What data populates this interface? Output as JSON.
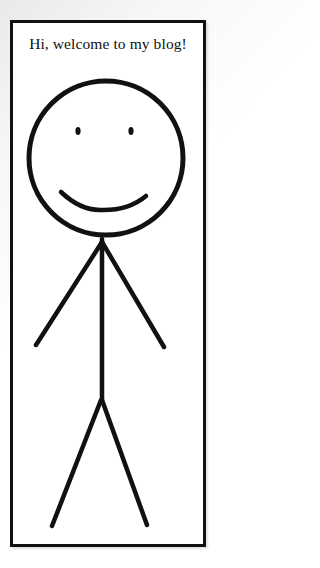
{
  "greeting": "Hi, welcome to my blog!",
  "drawing": {
    "subject": "smiling stick figure",
    "stroke_color": "#111111",
    "background_color": "#ffffff",
    "frame_color": "#111111"
  }
}
